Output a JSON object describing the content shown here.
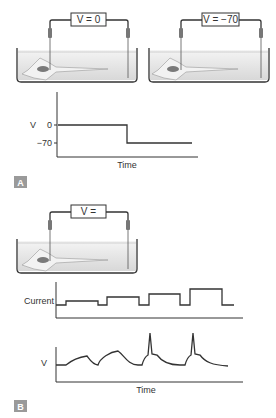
{
  "panel_a": {
    "label": "A",
    "setup_left": {
      "voltage_label": "V = 0"
    },
    "setup_right": {
      "voltage_label": "V = −70"
    },
    "plot": {
      "y_axis_label": "V",
      "y_ticks": [
        "0",
        "−70"
      ],
      "x_axis_label": "Time"
    }
  },
  "panel_b": {
    "label": "B",
    "setup": {
      "voltage_label": "V ="
    },
    "current_plot": {
      "y_axis_label": "Current"
    },
    "voltage_plot": {
      "y_axis_label": "V",
      "x_axis_label": "Time"
    }
  },
  "colors": {
    "line": "#333333",
    "bath_fill": "#e4e4e4",
    "panel_label_bg": "#9a9a9a",
    "cell_fill": "#f2f2f2",
    "nucleus": "#7a7a7a"
  }
}
